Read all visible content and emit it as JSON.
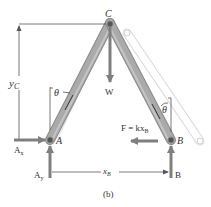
{
  "figure": {
    "caption": "(b)",
    "labels": {
      "C": "C",
      "A": "A",
      "B_point": "B",
      "B_force": "B",
      "W": "W",
      "Ax": "A",
      "Ax_sub": "x",
      "Ay": "A",
      "Ay_sub": "y",
      "yC": "y",
      "yC_sub": "C",
      "xB": "x",
      "xB_sub": "B",
      "theta_left": "θ",
      "theta_right": "θ",
      "F_eq": "F = kx",
      "F_sub": "B"
    },
    "colors": {
      "bar_fill": "#a9a9a9",
      "bar_edge": "#8a8a8a",
      "ghost_bar": "#d8d8d8",
      "arrow": "#7f7f7f",
      "line": "#555555",
      "pin": "#555555",
      "text": "#333333",
      "background": "#ffffff"
    }
  }
}
